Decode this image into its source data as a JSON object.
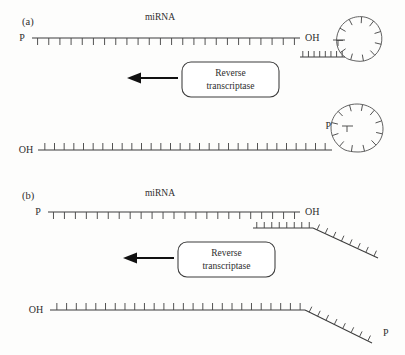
{
  "figure": {
    "type": "diagram",
    "background_color": "#fdfdfc",
    "stroke_color": "#3c3c3c",
    "tick_color": "#4a4a4a",
    "arrow_color": "#111111"
  },
  "panels": [
    {
      "id": "a",
      "label": "(a)",
      "primer_type": "stem-loop",
      "top": {
        "strand_name": "miRNA",
        "left_end_label": "P",
        "right_end_label": "OH",
        "backbone": {
          "x1": 32,
          "y1": 38,
          "x2": 300,
          "y2": 38
        },
        "tick_count": 24,
        "tick_direction": "down",
        "tick_length": 7,
        "label_positions": {
          "strand_name_x": 160,
          "strand_name_y": 20,
          "left_x": 22,
          "left_y": 41,
          "right_x": 305,
          "right_y": 41
        },
        "primer": {
          "stem": {
            "x1": 300,
            "y1": 57,
            "x2": 345,
            "y2": 57
          },
          "stem_tick_count": 8,
          "stem_tick_direction": "up",
          "loop_path": "M345,57 C337,52 334,40 339,30 C344,19 357,14 368,18 C379,22 384,34 381,45 C378,56 367,63 356,61 C350,60 347,59 345,57 Z",
          "loop_tick_count": 11,
          "stub": {
            "x1": 333,
            "y1": 40,
            "x2": 345,
            "y2": 40
          },
          "stub_tick": {
            "x1": 338,
            "y1": 40,
            "x2": 338,
            "y2": 46
          }
        }
      },
      "arrow": {
        "x1": 178,
        "y1": 78,
        "x2": 128,
        "y2": 78,
        "direction": "left"
      },
      "enzyme": {
        "line1": "Reverse",
        "line2": "transcriptase",
        "box": {
          "x": 182,
          "y": 62,
          "width": 97,
          "height": 35,
          "radius": 9
        }
      },
      "bottom": {
        "left_end_label": "OH",
        "right_end_label": "P",
        "backbone": {
          "x1": 38,
          "y1": 150,
          "x2": 330,
          "y2": 150
        },
        "tick_count": 30,
        "tick_direction": "up",
        "tick_length": 7,
        "label_positions": {
          "left_x": 26,
          "left_y": 153,
          "right_x": 331,
          "right_y": 126
        },
        "primer": {
          "stem": {
            "x1": 330,
            "y1": 150,
            "x2": 345,
            "y2": 150
          },
          "loop_path": "M345,150 C337,146 331,138 331,128 C331,114 343,104 357,104 C372,104 383,115 383,129 C383,142 372,152 358,152 C352,152 348,151 345,150 Z",
          "loop_tick_count": 12,
          "stub": {
            "x1": 342,
            "y1": 126,
            "x2": 353,
            "y2": 126
          },
          "stub_tick": {
            "x1": 347,
            "y1": 126,
            "x2": 347,
            "y2": 132
          }
        }
      }
    },
    {
      "id": "b",
      "label": "(b)",
      "primer_type": "linear",
      "top": {
        "strand_name": "miRNA",
        "left_end_label": "P",
        "right_end_label": "OH",
        "backbone": {
          "x1": 48,
          "y1": 212,
          "x2": 300,
          "y2": 212
        },
        "tick_count": 23,
        "tick_direction": "down",
        "tick_length": 7,
        "label_positions": {
          "strand_name_x": 160,
          "strand_name_y": 196,
          "left_x": 38,
          "left_y": 215,
          "right_x": 305,
          "right_y": 215
        },
        "primer": {
          "horizontal": {
            "x1": 253,
            "y1": 228,
            "x2": 313,
            "y2": 228
          },
          "horizontal_tick_count": 8,
          "horizontal_tick_direction": "up",
          "tail": {
            "x1": 313,
            "y1": 228,
            "x2": 378,
            "y2": 258
          },
          "tail_tick_count": 8
        }
      },
      "arrow": {
        "x1": 178,
        "y1": 258,
        "x2": 128,
        "y2": 258,
        "direction": "left"
      },
      "enzyme": {
        "line1": "Reverse",
        "line2": "transcriptase",
        "box": {
          "x": 178,
          "y": 242,
          "width": 97,
          "height": 35,
          "radius": 9
        }
      },
      "bottom": {
        "left_end_label": "OH",
        "right_end_label": "P",
        "backbone": {
          "x1": 58,
          "y1": 310,
          "x2": 305,
          "y2": 310
        },
        "tick_count": 26,
        "tick_direction": "up",
        "tick_length": 7,
        "label_positions": {
          "left_x": 36,
          "left_y": 313,
          "right_x": 383,
          "right_y": 336
        },
        "tail": {
          "x1": 305,
          "y1": 310,
          "x2": 372,
          "y2": 343
        },
        "tail_tick_count": 8
      }
    }
  ]
}
